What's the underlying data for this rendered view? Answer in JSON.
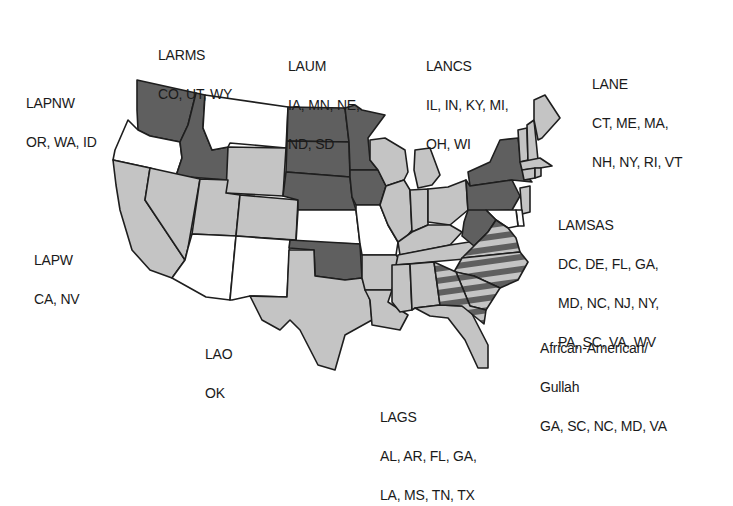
{
  "map": {
    "title": "",
    "colors": {
      "dark": "#5f5f5f",
      "light": "#c4c4c4",
      "none": "#ffffff",
      "stripe_a": "#5f5f5f",
      "stripe_b": "#c4c4c4",
      "border": "#1e1e1e"
    }
  },
  "regions": [
    {
      "id": "larms",
      "title": "LARMS",
      "lines": [
        "CO, UT, WY"
      ]
    },
    {
      "id": "laum",
      "title": "LAUM",
      "lines": [
        "IA, MN, NE,",
        "ND, SD"
      ]
    },
    {
      "id": "lancs",
      "title": "LANCS",
      "lines": [
        "IL, IN, KY, MI,",
        "OH, WI"
      ]
    },
    {
      "id": "lane",
      "title": "LANE",
      "lines": [
        "CT, ME, MA,",
        "NH, NY, RI, VT"
      ]
    },
    {
      "id": "lapnw",
      "title": "LAPNW",
      "lines": [
        "OR, WA, ID"
      ]
    },
    {
      "id": "lamsas",
      "title": "LAMSAS",
      "lines": [
        "DC, DE, FL, GA,",
        "MD, NC, NJ, NY,",
        "PA, SC, VA, WV"
      ]
    },
    {
      "id": "lapw",
      "title": "LAPW",
      "lines": [
        "CA, NV"
      ]
    },
    {
      "id": "lao",
      "title": "LAO",
      "lines": [
        "OK"
      ]
    },
    {
      "id": "aa_gullah",
      "title": "African-American/",
      "lines": [
        "Gullah",
        "GA, SC, NC, MD, VA"
      ]
    },
    {
      "id": "lags",
      "title": "LAGS",
      "lines": [
        "AL, AR, FL, GA,",
        "LA, MS, TN, TX"
      ]
    }
  ]
}
